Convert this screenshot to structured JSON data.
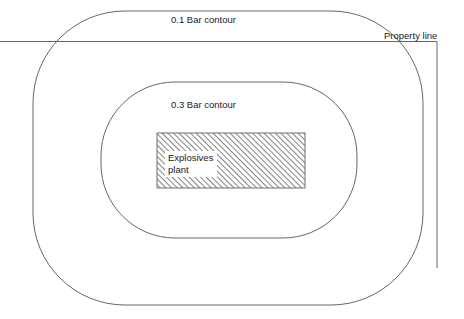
{
  "diagram": {
    "background_color": "#ffffff",
    "line_color": "#555555",
    "text_color": "#1a1a1a",
    "hatch_color": "#6e6e6e",
    "labels": {
      "outer_contour": "0.1 Bar contour",
      "inner_contour": "0.3 Bar contour",
      "property_line": "Property line",
      "plant_line1": "Explosives",
      "plant_line2": "plant"
    },
    "shapes": {
      "outer_contour": {
        "name": "0.1 Bar contour",
        "x": 33,
        "y": 11,
        "width": 390,
        "height": 294,
        "corner_radius": 92
      },
      "inner_contour": {
        "name": "0.3 Bar contour",
        "x": 101,
        "y": 82,
        "width": 256,
        "height": 156,
        "corner_radius": 74
      },
      "plant_box": {
        "name": "Explosives plant",
        "x": 157,
        "y": 133,
        "width": 148,
        "height": 55,
        "fill": "hatched-45"
      },
      "property_line_horizontal": {
        "x1": 0,
        "y1": 41,
        "x2": 437,
        "y2": 41
      },
      "property_line_vertical": {
        "x1": 437,
        "y1": 41,
        "x2": 437,
        "y2": 268
      }
    }
  }
}
